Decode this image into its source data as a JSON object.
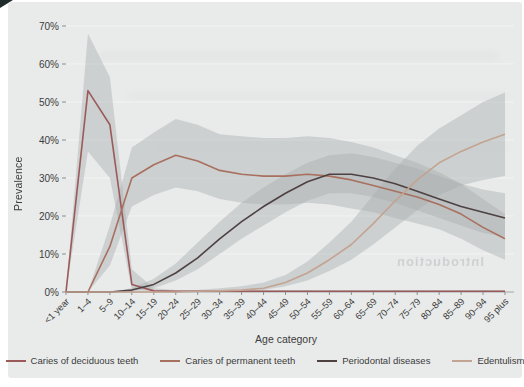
{
  "figure": {
    "background": "#e9ebea",
    "ylabel": "Prevalence",
    "xlabel": "Age category",
    "watermark": "Introduction"
  },
  "legend": {
    "position": "bottom",
    "items": [
      {
        "label": "Caries of deciduous teeth"
      },
      {
        "label": "Caries of permanent teeth"
      },
      {
        "label": "Periodontal diseases"
      },
      {
        "label": "Edentulism"
      }
    ]
  },
  "chart_data": {
    "type": "line",
    "title": "",
    "xlabel": "Age category",
    "ylabel": "Prevalence",
    "ylim": [
      0,
      70
    ],
    "grid": true,
    "legend_position": "bottom",
    "band_color": "#a7abad",
    "band_opacity": 0.42,
    "yticks": [
      "0%",
      "10%",
      "20%",
      "30%",
      "40%",
      "50%",
      "60%",
      "70%"
    ],
    "categories": [
      "<1 year",
      "1–4",
      "5–9",
      "10–14",
      "15–19",
      "20–24",
      "25–29",
      "30–34",
      "35–39",
      "40–44",
      "45–49",
      "50–54",
      "55–59",
      "60–64",
      "65–69",
      "70–74",
      "75–79",
      "80–84",
      "85–89",
      "90–94",
      "95 plus"
    ],
    "series": [
      {
        "id": "caries-deciduous",
        "name": "Caries of deciduous teeth",
        "color": "#9b5a5a",
        "values": [
          0,
          53,
          44,
          2,
          0.3,
          0.2,
          0.2,
          0.2,
          0.2,
          0.2,
          0.2,
          0.2,
          0.2,
          0.2,
          0.2,
          0.2,
          0.2,
          0.2,
          0.2,
          0.2,
          0.2
        ],
        "band_upper": [
          0,
          68,
          56.5,
          6,
          1,
          0.5,
          0.5,
          0.5,
          0.5,
          0.5,
          0.5,
          0.5,
          0.5,
          0.5,
          0.5,
          0.5,
          0.5,
          0.5,
          0.5,
          0.5,
          0.5
        ],
        "band_lower": [
          0,
          37,
          30,
          0.5,
          0.1,
          0.1,
          0.1,
          0.1,
          0.1,
          0.1,
          0.1,
          0.1,
          0.1,
          0.1,
          0.1,
          0.1,
          0.1,
          0.1,
          0.1,
          0.1,
          0.1
        ]
      },
      {
        "id": "caries-permanent",
        "name": "Caries of permanent teeth",
        "color": "#a8705f",
        "values": [
          0,
          0,
          12,
          30,
          33.5,
          36,
          34.5,
          32,
          31,
          30.5,
          30.5,
          31,
          30.5,
          29.5,
          28,
          26.5,
          25,
          23,
          20.5,
          17,
          14
        ],
        "band_upper": [
          0,
          0,
          17.5,
          38,
          42,
          45.5,
          44,
          41.5,
          41,
          40.5,
          40.5,
          41,
          40.5,
          39.5,
          38,
          36,
          34,
          31.5,
          28.5,
          24.5,
          20.5
        ],
        "band_lower": [
          0,
          0,
          7,
          22.5,
          25.5,
          27.5,
          26.5,
          24.5,
          23.5,
          23,
          23,
          23.5,
          23,
          22,
          21,
          19.5,
          18,
          16.5,
          14,
          11,
          8.5
        ]
      },
      {
        "id": "periodontal-diseases",
        "name": "Periodontal diseases",
        "color": "#4e4142",
        "values": [
          0,
          0,
          0,
          0.5,
          2,
          5,
          9,
          14,
          18.5,
          22.5,
          26,
          29,
          31,
          31,
          30,
          28.5,
          26.5,
          24.5,
          22.5,
          21,
          19.5
        ],
        "band_upper": [
          0,
          0,
          0,
          1,
          3.5,
          7.5,
          13,
          18.5,
          23.5,
          27.5,
          31,
          34,
          36,
          36.5,
          35.5,
          34,
          32.5,
          30.5,
          28.5,
          27,
          26
        ],
        "band_lower": [
          0,
          0,
          0,
          0.2,
          1,
          3,
          6,
          10,
          14,
          17.5,
          21,
          24,
          26,
          26,
          25,
          23.5,
          21.5,
          19.5,
          17.5,
          15.5,
          14.5
        ]
      },
      {
        "id": "edentulism",
        "name": "Edentulism",
        "color": "#c3a391",
        "values": [
          0,
          0,
          0,
          0,
          0,
          0,
          0.2,
          0.3,
          0.5,
          1,
          2.5,
          5,
          8.5,
          12.5,
          18,
          24,
          29.5,
          34,
          37,
          39.5,
          41.5
        ],
        "band_upper": [
          0,
          0,
          0,
          0,
          0,
          0.2,
          0.5,
          1,
          1.5,
          2.5,
          4.5,
          8,
          13,
          18.5,
          25.5,
          32.5,
          38.5,
          43,
          46.5,
          50,
          52.5
        ],
        "band_lower": [
          0,
          0,
          0,
          0,
          0,
          0,
          0.1,
          0.1,
          0.2,
          0.5,
          1.5,
          3,
          5.5,
          8.5,
          12.5,
          17,
          21.5,
          25.5,
          28,
          29.5,
          30.5
        ]
      }
    ]
  }
}
